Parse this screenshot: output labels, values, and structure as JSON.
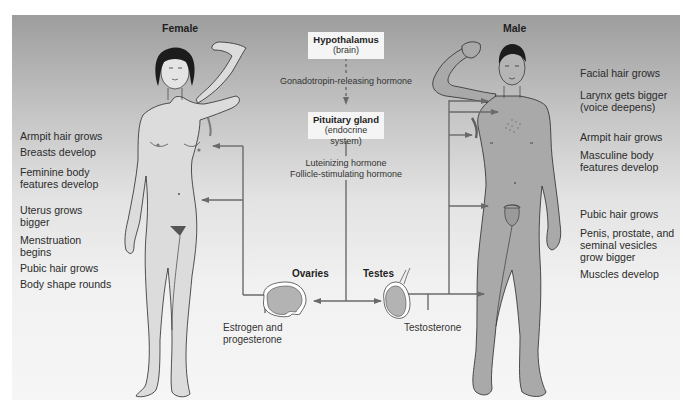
{
  "figure": {
    "female_title": "Female",
    "male_title": "Male",
    "center": {
      "hypothalamus": {
        "name": "Hypothalamus",
        "sub": "(brain)"
      },
      "grh_label": "Gonadotropin-releasing hormone",
      "pituitary": {
        "name": "Pituitary gland",
        "sub": "(endocrine system)"
      },
      "lh_label": "Luteinizing hormone",
      "fsh_label": "Follicle-stimulating hormone"
    },
    "ovaries": {
      "title": "Ovaries",
      "hormone_line1": "Estrogen and",
      "hormone_line2": "progesterone"
    },
    "testes": {
      "title": "Testes",
      "hormone": "Testosterone"
    },
    "female_effects": [
      {
        "line1": "Armpit hair grows"
      },
      {
        "line1": "Breasts develop"
      },
      {
        "line1": "Feminine body",
        "line2": "features develop"
      },
      {
        "line1": "Uterus grows",
        "line2": "bigger"
      },
      {
        "line1": "Menstruation",
        "line2": "begins"
      },
      {
        "line1": "Pubic hair grows"
      },
      {
        "line1": "Body shape rounds"
      }
    ],
    "male_effects": [
      {
        "line1": "Facial hair grows"
      },
      {
        "line1": "Larynx gets bigger",
        "line2": "(voice deepens)"
      },
      {
        "line1": "Armpit hair grows"
      },
      {
        "line1": "Masculine body",
        "line2": "features develop"
      },
      {
        "line1": "Pubic hair grows"
      },
      {
        "line1": "Penis, prostate, and",
        "line2": "seminal vesicles",
        "line3": "grow bigger"
      },
      {
        "line1": "Muscles develop"
      }
    ],
    "colors": {
      "female_skin": "#dcdcdc",
      "male_skin": "#a9a9a9",
      "arrow": "#6a6a6a",
      "outline": "#2a2a2a",
      "hair": "#1c1c1c"
    }
  }
}
